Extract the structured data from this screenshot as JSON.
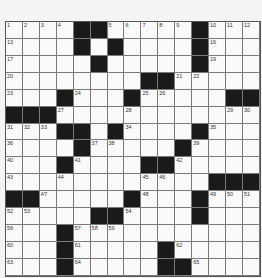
{
  "puzzle": {
    "rows": 15,
    "cols": 15,
    "colors": {
      "white": "#fafafa",
      "black": "#1a1a1a",
      "line": "#7a7a7a"
    },
    "layout": [
      "....##.....#...",
      "....#.#....#...",
      ".....#.....#...",
      "........##.....",
      "...#...#.....##",
      "###...........",
      "...##.#....#...",
      "....#.....#....",
      "...#....##.....",
      "............###",
      "##.....#...#...",
      ".....##....#...",
      "...#...........",
      "...#.....#.....",
      "...#.....##...."
    ],
    "numbers": [
      {
        "r": 0,
        "c": 0,
        "n": "1"
      },
      {
        "r": 0,
        "c": 1,
        "n": "2"
      },
      {
        "r": 0,
        "c": 2,
        "n": "3"
      },
      {
        "r": 0,
        "c": 3,
        "n": "4"
      },
      {
        "r": 0,
        "c": 6,
        "n": "5"
      },
      {
        "r": 0,
        "c": 7,
        "n": "6"
      },
      {
        "r": 0,
        "c": 8,
        "n": "7"
      },
      {
        "r": 0,
        "c": 9,
        "n": "8"
      },
      {
        "r": 0,
        "c": 10,
        "n": "9"
      },
      {
        "r": 0,
        "c": 12,
        "n": "10"
      },
      {
        "r": 0,
        "c": 13,
        "n": "11"
      },
      {
        "r": 0,
        "c": 14,
        "n": "12"
      },
      {
        "r": 1,
        "c": 0,
        "n": "13"
      },
      {
        "r": 1,
        "c": 4,
        "n": "14"
      },
      {
        "r": 1,
        "c": 6,
        "n": "15"
      },
      {
        "r": 1,
        "c": 12,
        "n": "16"
      },
      {
        "r": 2,
        "c": 0,
        "n": "17"
      },
      {
        "r": 2,
        "c": 5,
        "n": "18"
      },
      {
        "r": 2,
        "c": 12,
        "n": "19"
      },
      {
        "r": 3,
        "c": 0,
        "n": "20"
      },
      {
        "r": 3,
        "c": 10,
        "n": "21"
      },
      {
        "r": 3,
        "c": 11,
        "n": "22"
      },
      {
        "r": 4,
        "c": 0,
        "n": "23"
      },
      {
        "r": 4,
        "c": 4,
        "n": "24"
      },
      {
        "r": 4,
        "c": 8,
        "n": "25"
      },
      {
        "r": 4,
        "c": 9,
        "n": "26"
      },
      {
        "r": 5,
        "c": 3,
        "n": "27"
      },
      {
        "r": 5,
        "c": 7,
        "n": "28"
      },
      {
        "r": 5,
        "c": 13,
        "n": "29"
      },
      {
        "r": 5,
        "c": 14,
        "n": "30"
      },
      {
        "r": 6,
        "c": 0,
        "n": "31"
      },
      {
        "r": 6,
        "c": 1,
        "n": "32"
      },
      {
        "r": 6,
        "c": 2,
        "n": "33"
      },
      {
        "r": 6,
        "c": 7,
        "n": "34"
      },
      {
        "r": 6,
        "c": 12,
        "n": "35"
      },
      {
        "r": 7,
        "c": 0,
        "n": "36"
      },
      {
        "r": 7,
        "c": 5,
        "n": "37"
      },
      {
        "r": 7,
        "c": 6,
        "n": "38"
      },
      {
        "r": 7,
        "c": 11,
        "n": "39"
      },
      {
        "r": 8,
        "c": 0,
        "n": "40"
      },
      {
        "r": 8,
        "c": 4,
        "n": "41"
      },
      {
        "r": 8,
        "c": 10,
        "n": "42"
      },
      {
        "r": 9,
        "c": 0,
        "n": "43"
      },
      {
        "r": 9,
        "c": 3,
        "n": "44"
      },
      {
        "r": 9,
        "c": 8,
        "n": "45"
      },
      {
        "r": 9,
        "c": 9,
        "n": "46"
      },
      {
        "r": 10,
        "c": 2,
        "n": "47"
      },
      {
        "r": 10,
        "c": 8,
        "n": "48"
      },
      {
        "r": 10,
        "c": 12,
        "n": "49"
      },
      {
        "r": 10,
        "c": 13,
        "n": "50"
      },
      {
        "r": 10,
        "c": 14,
        "n": "51"
      },
      {
        "r": 11,
        "c": 0,
        "n": "52"
      },
      {
        "r": 11,
        "c": 1,
        "n": "53"
      },
      {
        "r": 11,
        "c": 7,
        "n": "54"
      },
      {
        "r": 11,
        "c": 11,
        "n": "55"
      },
      {
        "r": 12,
        "c": 0,
        "n": "56"
      },
      {
        "r": 12,
        "c": 4,
        "n": "57"
      },
      {
        "r": 12,
        "c": 5,
        "n": "58"
      },
      {
        "r": 12,
        "c": 6,
        "n": "59"
      },
      {
        "r": 13,
        "c": 0,
        "n": "60"
      },
      {
        "r": 13,
        "c": 4,
        "n": "61"
      },
      {
        "r": 13,
        "c": 10,
        "n": "62"
      },
      {
        "r": 14,
        "c": 0,
        "n": "63"
      },
      {
        "r": 14,
        "c": 4,
        "n": "64"
      },
      {
        "r": 14,
        "c": 11,
        "n": "65"
      }
    ]
  }
}
